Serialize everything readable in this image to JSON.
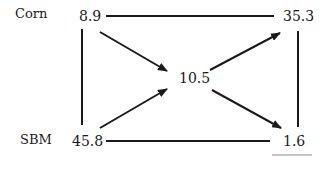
{
  "diagram": {
    "row_labels": {
      "top": "Corn",
      "bottom": "SBM"
    },
    "nodes": {
      "top_left": "8.9",
      "top_right": "35.3",
      "center": "10.5",
      "bottom_left": "45.8",
      "bottom_right": "1.6"
    },
    "edges": [
      {
        "from": "top_left",
        "to": "top_right",
        "arrow": false
      },
      {
        "from": "top_left",
        "to": "bottom_left",
        "arrow": false
      },
      {
        "from": "top_right",
        "to": "bottom_right",
        "arrow": false
      },
      {
        "from": "bottom_left",
        "to": "bottom_right",
        "arrow": false
      },
      {
        "from": "top_left",
        "to": "center",
        "arrow": true
      },
      {
        "from": "bottom_left",
        "to": "center",
        "arrow": true
      },
      {
        "from": "center",
        "to": "top_right",
        "arrow": true
      },
      {
        "from": "center",
        "to": "bottom_right",
        "arrow": true
      }
    ]
  }
}
